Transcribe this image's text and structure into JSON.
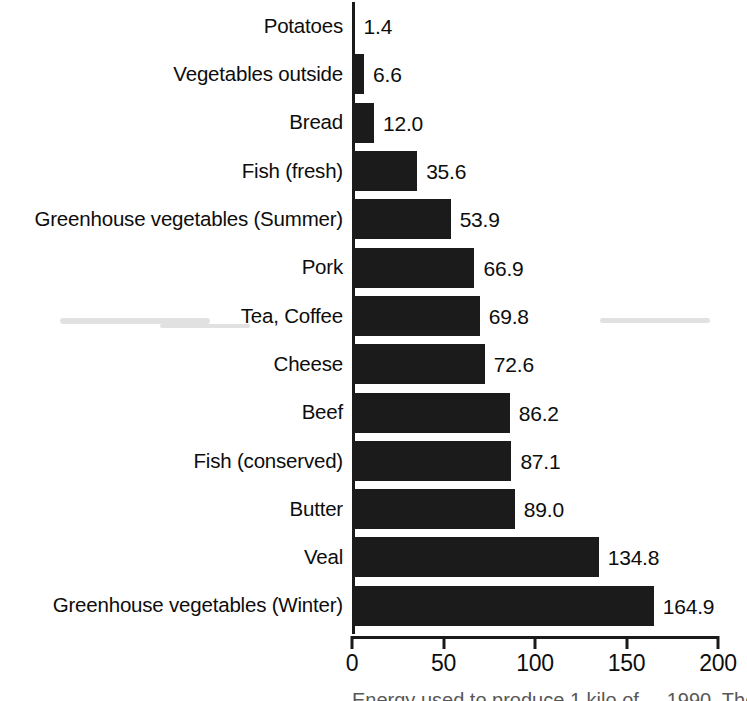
{
  "chart_data": {
    "type": "bar",
    "orientation": "horizontal",
    "title": "",
    "subtitle": "",
    "xlabel": "",
    "ylabel": "",
    "xlim": [
      0,
      200
    ],
    "grid": false,
    "legend": null,
    "categories": [
      "Potatoes",
      "Vegetables outside",
      "Bread",
      "Fish (fresh)",
      "Greenhouse vegetables (Summer)",
      "Pork",
      "Tea, Coffee",
      "Cheese",
      "Beef",
      "Fish (conserved)",
      "Butter",
      "Veal",
      "Greenhouse vegetables (Winter)"
    ],
    "values": [
      1.4,
      6.6,
      12.0,
      35.6,
      53.9,
      66.9,
      69.8,
      72.6,
      86.2,
      87.1,
      89.0,
      134.8,
      164.9
    ],
    "value_labels": [
      "1.4",
      "6.6",
      "12.0",
      "35.6",
      "53.9",
      "66.9",
      "69.8",
      "72.6",
      "86.2",
      "87.1",
      "89.0",
      "134.8",
      "164.9"
    ],
    "xticks": [
      0,
      50,
      100,
      150,
      200
    ],
    "xtick_labels": [
      "0",
      "50",
      "100",
      "150",
      "200"
    ],
    "bar_color": "#1b1b1b",
    "background_color": "#ffffff",
    "text_color": "#0d0d0d"
  },
  "caption": {
    "clipped_text": "Energy used to produce 1 kilo of ... 1990. The numbers ..."
  }
}
